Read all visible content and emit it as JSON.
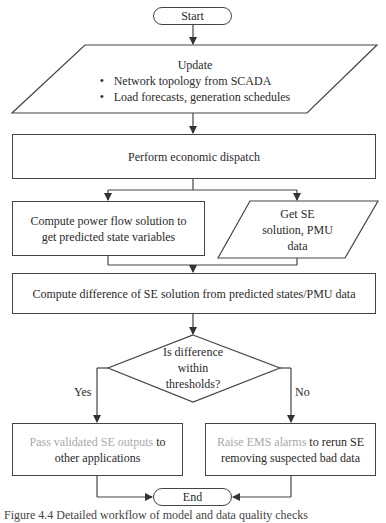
{
  "flowchart": {
    "start": "Start",
    "update": {
      "title": "Update",
      "bullets": [
        "Network topology from SCADA",
        "Load forecasts, generation schedules"
      ]
    },
    "economic_dispatch": "Perform economic dispatch",
    "power_flow": "Compute power flow solution to get predicted state variables",
    "get_se": [
      "Get SE",
      "solution, PMU",
      "data"
    ],
    "compute_difference": "Compute difference of SE solution from predicted states/PMU data",
    "decision": [
      "Is difference",
      "within",
      "thresholds?"
    ],
    "yes_label": "Yes",
    "no_label": "No",
    "pass_outputs": {
      "faded": "Pass validated SE outputs",
      "normal": " to other applications"
    },
    "raise_alarms": {
      "faded": "Raise EMS alarms",
      "normal": " to rerun SE removing suspected bad data"
    },
    "end": "End"
  },
  "caption": "Figure 4.4  Detailed workflow of model and data quality checks",
  "colors": {
    "line": "#444444",
    "faded_text": "#a8a8a8",
    "text": "#2a2a2a"
  }
}
